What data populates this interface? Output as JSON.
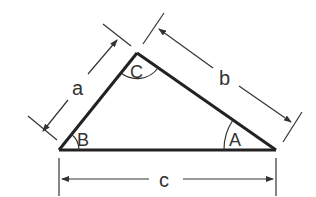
{
  "diagram": {
    "type": "triangle",
    "colors": {
      "stroke": "#222222",
      "dim": "#333333",
      "background": "#ffffff"
    },
    "vertices": {
      "B": {
        "label": "B",
        "x": 59,
        "y": 150
      },
      "C": {
        "label": "C",
        "x": 137,
        "y": 53
      },
      "A": {
        "label": "A",
        "x": 276,
        "y": 150
      }
    },
    "sides": {
      "a": {
        "label": "a"
      },
      "b": {
        "label": "b"
      },
      "c": {
        "label": "c"
      }
    }
  }
}
